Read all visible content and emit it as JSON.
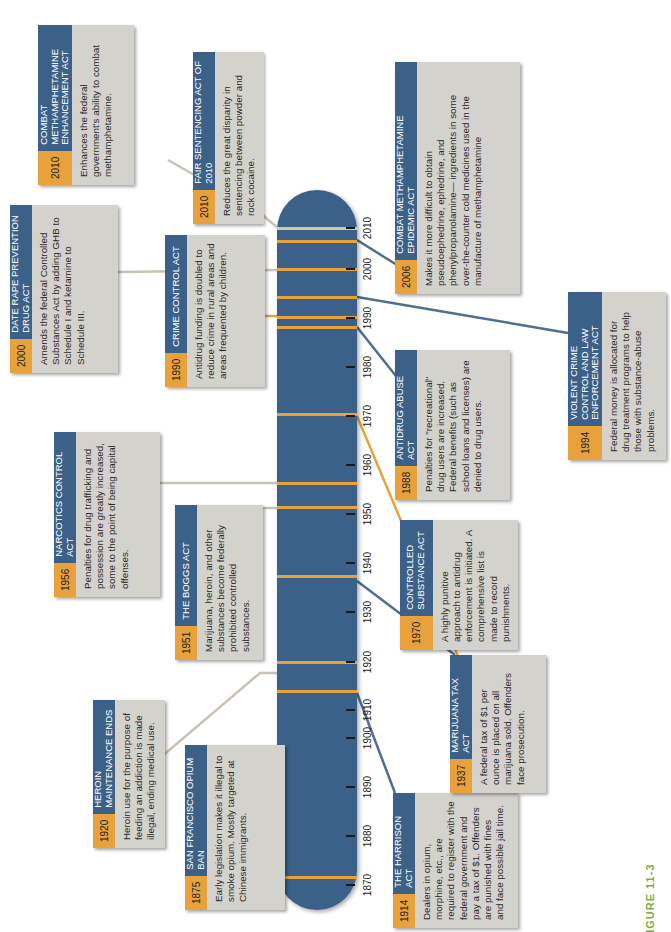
{
  "figure_label": "FIGURE 11-3",
  "timeline": {
    "axis_labels": [
      "1870",
      "1880",
      "1890",
      "1900",
      "1910",
      "1920",
      "1930",
      "1940",
      "1950",
      "1960",
      "1970",
      "1980",
      "1990",
      "2000",
      "2010"
    ],
    "bar_color": "#3c6189",
    "marker_color": "#e9a23b"
  },
  "events": [
    {
      "year": "1875",
      "title": "SAN FRANCISCO OPIUM BAN",
      "body": "Early legislation makes it illegal to smoke opium. Mostly targeted at Chinese immigrants."
    },
    {
      "year": "1914",
      "title": "THE HARRISON ACT",
      "body": "Dealers in opium, morphine, etc., are required to register with the federal government and pay a tax of $1. Offenders are punished with fines and face possible jail time."
    },
    {
      "year": "1920",
      "title": "HEROIN MAINTENANCE ENDS",
      "body": "Heroin use for the purpose of feeding an addiction is made illegal, ending medical use."
    },
    {
      "year": "1937",
      "title": "MARIJUANA TAX ACT",
      "body": "A federal tax of $1 per ounce is placed on all marijuana sold. Offenders face prosecution."
    },
    {
      "year": "1951",
      "title": "THE BOGGS ACT",
      "body": "Marijuana, heroin, and other substances become federally prohibited controlled substances."
    },
    {
      "year": "1956",
      "title": "NARCOTICS CONTROL ACT",
      "body": "Penalties for drug trafficking and possession are greatly increased, some to the point of being capital offenses."
    },
    {
      "year": "1970",
      "title": "CONTROLLED SUBSTANCE ACT",
      "body": "A highly punitive approach to antidrug enforcement is initiated. A comprehensive list is made to record punishments."
    },
    {
      "year": "1988",
      "title": "ANTIDRUG ABUSE ACT",
      "body": "Penalties for \"recreational\" drug users are increased. Federal benefits (such as school loans and licenses) are denied to drug users."
    },
    {
      "year": "1990",
      "title": "CRIME CONTROL ACT",
      "body": "Antidrug funding is doubled to reduce crime in rural areas and areas frequented by children."
    },
    {
      "year": "1994",
      "title": "VIOLENT CRIME CONTROL AND LAW ENFORCEMENT ACT",
      "body": "Federal money is allocated for drug treatment programs to help those with substance-abuse problems."
    },
    {
      "year": "2000",
      "title": "DATE RAPE PREVENTION DRUG ACT",
      "body": "Amends the federal Controlled Substances Act by adding GHB to Schedule I and ketamine to Schedule III."
    },
    {
      "year": "2006",
      "title": "COMBAT METHAMPHETAMINE EPIDEMIC ACT",
      "body": "Makes it more difficult to obtain pseudoephedrine, ephedrine, and phenylpropanolamine— ingredients in some over-the-counter cold medicines used in the manufacture of methamphetamine"
    },
    {
      "year": "2010",
      "title": "FAIR SENTENCING ACT OF 2010",
      "body": "Reduces the great disparity in sentencing between powder and rock cocaine."
    },
    {
      "year": "2010",
      "title": "COMBAT METHAMPHETAMINE ENHANCEMENT ACT",
      "body": "Enhances the federal government's ability to combat methamphetamine."
    }
  ]
}
